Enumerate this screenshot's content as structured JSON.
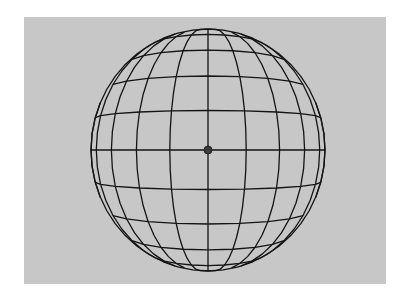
{
  "figure": {
    "background_color": "#ffffff",
    "panel_color": "#c7c7c7",
    "line_color": "#141414",
    "line_width": 1.3,
    "center_dot_color": "#3a3a3a"
  },
  "sphere": {
    "center_x": 208,
    "center_y": 150,
    "radius_x": 117,
    "radius_y": 121,
    "camera_distance_radii": 4.2,
    "meridian_step_deg": 15,
    "parallel_step_deg": 15,
    "segments_per_line": 24,
    "center_dot_radius": 4
  }
}
